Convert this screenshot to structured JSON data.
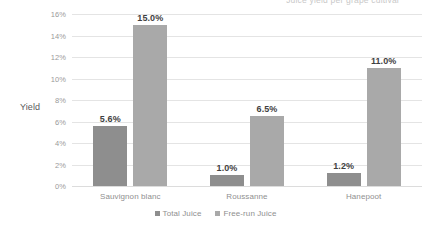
{
  "clipped_title": "Juice yield per grape cultivar",
  "axis_title_y": "Yield",
  "legend": {
    "items": [
      {
        "label": "Total Juice",
        "color": "#8e8e8e"
      },
      {
        "label": "Free-run Juice",
        "color": "#a9a9a9"
      }
    ]
  },
  "y_ticks": [
    "0%",
    "2%",
    "4%",
    "6%",
    "8%",
    "10%",
    "12%",
    "14%",
    "16%"
  ],
  "categories": [
    "Sauvignon blanc",
    "Roussanne",
    "Hanepoot"
  ],
  "labels": {
    "total": [
      "5.6%",
      "1.0%",
      "1.2%"
    ],
    "freerun": [
      "15.0%",
      "6.5%",
      "11.0%"
    ]
  },
  "chart_data": {
    "type": "bar",
    "title": "Juice yield per grape cultivar",
    "xlabel": "",
    "ylabel": "Yield",
    "ylim": [
      0,
      16
    ],
    "ytick_step": 2,
    "ytick_labels": [
      "0%",
      "2%",
      "4%",
      "6%",
      "8%",
      "10%",
      "12%",
      "14%",
      "16%"
    ],
    "grid": true,
    "legend_position": "bottom",
    "categories": [
      "Sauvignon blanc",
      "Roussanne",
      "Hanepoot"
    ],
    "series": [
      {
        "name": "Total Juice",
        "color": "#8e8e8e",
        "values": [
          5.6,
          1.0,
          1.2
        ],
        "data_labels": [
          "5.6%",
          "1.0%",
          "1.2%"
        ]
      },
      {
        "name": "Free-run Juice",
        "color": "#a9a9a9",
        "values": [
          15.0,
          6.5,
          11.0
        ],
        "data_labels": [
          "15.0%",
          "6.5%",
          "11.0%"
        ]
      }
    ]
  }
}
